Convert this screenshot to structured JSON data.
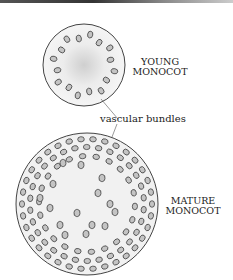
{
  "diagram": {
    "young": {
      "label_line1": "YOUNG",
      "label_line2": "MONOCOT",
      "cx": 84,
      "cy": 65,
      "r": 41
    },
    "mature": {
      "label_line1": "MATURE",
      "label_line2": "MONOCOT",
      "cx": 87,
      "cy": 204,
      "r": 71
    },
    "callout": "vascular bundles",
    "colors": {
      "outline": "#444444",
      "fill": "#f0f0f0",
      "bundle_fill": "#bdbdbd",
      "bundle_stroke": "#333333"
    }
  }
}
